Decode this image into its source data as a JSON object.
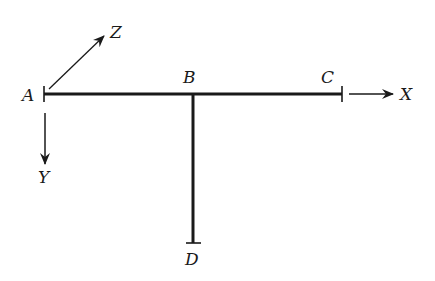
{
  "diagram": {
    "type": "frame-structure",
    "colors": {
      "ink": "#1a1a1a",
      "background": "#ffffff"
    },
    "nodes": [
      {
        "id": "A",
        "label": "A",
        "x": 44,
        "y": 94
      },
      {
        "id": "B",
        "label": "B",
        "x": 193,
        "y": 94
      },
      {
        "id": "C",
        "label": "C",
        "x": 342,
        "y": 94
      },
      {
        "id": "D",
        "label": "D",
        "x": 193,
        "y": 243
      }
    ],
    "members": [
      {
        "from": "A",
        "to": "C"
      },
      {
        "from": "B",
        "to": "D"
      }
    ],
    "axes": [
      {
        "id": "X",
        "label": "X"
      },
      {
        "id": "Y",
        "label": "Y"
      },
      {
        "id": "Z",
        "label": "Z"
      }
    ]
  }
}
